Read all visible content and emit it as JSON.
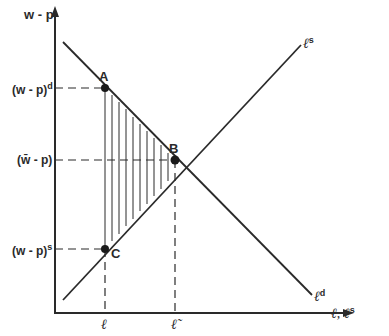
{
  "diagram": {
    "type": "labor-market-diagram",
    "y_axis_label": "w - p",
    "x_axis_label": "ℓ, ℓ",
    "x_axis_label_sup": "s",
    "y_ticks": [
      {
        "label": "(w - p)",
        "sup": "d"
      },
      {
        "label": "(w̄ - p)",
        "sup": ""
      },
      {
        "label": "(w - p)",
        "sup": "s"
      }
    ],
    "x_ticks": [
      "ℓ",
      "ℓ̃"
    ],
    "curves": [
      {
        "name": "ℓ",
        "sup": "s",
        "kind": "supply"
      },
      {
        "name": "ℓ",
        "sup": "d",
        "kind": "demand"
      }
    ],
    "points": [
      "A",
      "B",
      "C"
    ],
    "shaded_region": "triangle A-B-C (vertical hatching)",
    "colors": {
      "line": "#2a2a2a",
      "background": "#ffffff"
    }
  }
}
